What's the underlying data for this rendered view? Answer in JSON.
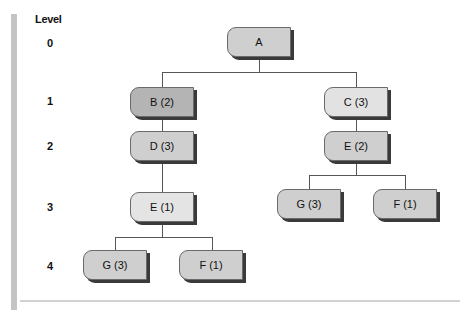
{
  "header": {
    "level_label": "Level"
  },
  "levels": [
    "0",
    "1",
    "2",
    "3",
    "4"
  ],
  "colors": {
    "node_default": "#cfcfcf",
    "node_dark": "#b4b4b4",
    "node_light": "#e2e2e2",
    "line": "#555555",
    "left_bar": "#c4c4c4"
  },
  "nodes": {
    "a": {
      "label": "A",
      "level": 0
    },
    "b": {
      "label": "B (2)",
      "level": 1
    },
    "c": {
      "label": "C (3)",
      "level": 1
    },
    "d": {
      "label": "D (3)",
      "level": 2
    },
    "e_right": {
      "label": "E (2)",
      "level": 2
    },
    "e_left": {
      "label": "E (1)",
      "level": 3
    },
    "g_right": {
      "label": "G (3)",
      "level": 3
    },
    "f_right": {
      "label": "F (1)",
      "level": 3
    },
    "g_left": {
      "label": "G (3)",
      "level": 4
    },
    "f_left": {
      "label": "F (1)",
      "level": 4
    }
  },
  "edges": [
    [
      "A",
      "B (2)"
    ],
    [
      "A",
      "C (3)"
    ],
    [
      "B (2)",
      "D (3)"
    ],
    [
      "D (3)",
      "E (1)"
    ],
    [
      "E (1)",
      "G (3)"
    ],
    [
      "E (1)",
      "F (1)"
    ],
    [
      "C (3)",
      "E (2)"
    ],
    [
      "E (2)",
      "G (3)"
    ],
    [
      "E (2)",
      "F (1)"
    ]
  ]
}
